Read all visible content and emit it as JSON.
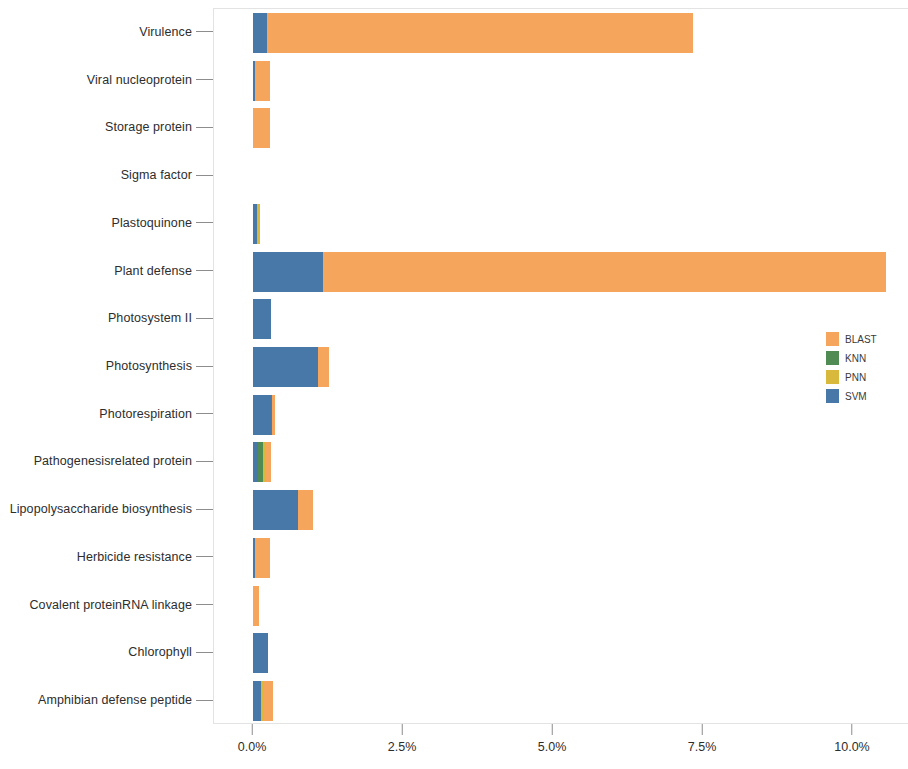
{
  "chart_data": {
    "type": "bar",
    "orientation": "horizontal",
    "stacked": true,
    "title": "",
    "subtitle": "",
    "xlabel": "",
    "ylabel": "",
    "xlim": [
      0,
      11.583
    ],
    "xtick_labels": [
      "0.0%",
      "2.5%",
      "5.0%",
      "7.5%",
      "10.0%"
    ],
    "xtick_values": [
      0,
      2.5,
      5.0,
      7.5,
      10.0
    ],
    "grid": false,
    "legend_position": "right",
    "legend": [
      "BLAST",
      "KNN",
      "PNN",
      "SVM"
    ],
    "series_colors": {
      "BLAST": "#f5a55c",
      "KNN": "#4f8b52",
      "PNN": "#d8b93c",
      "SVM": "#4878a8"
    },
    "categories": [
      "Virulence",
      "Viral nucleoprotein",
      "Storage protein",
      "Sigma factor",
      "Plastoquinone",
      "Plant defense",
      "Photosystem II",
      "Photosynthesis",
      "Photorespiration",
      "Pathogenesisrelated protein",
      "Lipopolysaccharide biosynthesis",
      "Herbicide resistance",
      "Covalent proteinRNA linkage",
      "Chlorophyll",
      "Amphibian defense peptide"
    ],
    "series": [
      {
        "name": "SVM",
        "values": [
          0.233,
          0.033,
          0.0,
          0.0,
          0.067,
          1.167,
          0.3,
          1.083,
          0.3,
          0.083,
          0.75,
          0.033,
          0.0,
          0.25,
          0.133
        ]
      },
      {
        "name": "KNN",
        "values": [
          0.0,
          0.0,
          0.0,
          0.0,
          0.0,
          0.0,
          0.0,
          0.0,
          0.017,
          0.083,
          0.0,
          0.0,
          0.0,
          0.0,
          0.0
        ]
      },
      {
        "name": "PNN",
        "values": [
          0.0,
          0.0,
          0.0,
          0.0,
          0.05,
          0.0,
          0.0,
          0.0,
          0.0,
          0.05,
          0.0,
          0.0,
          0.0,
          0.0,
          0.05
        ]
      },
      {
        "name": "BLAST",
        "values": [
          7.1,
          0.25,
          0.283,
          0.0,
          0.0,
          9.383,
          0.0,
          0.183,
          0.05,
          0.083,
          0.25,
          0.25,
          0.1,
          0.0,
          0.15
        ]
      }
    ],
    "stack_order": [
      "SVM",
      "KNN",
      "PNN",
      "BLAST"
    ],
    "totals": [
      7.333,
      0.283,
      0.283,
      0.0,
      0.117,
      10.55,
      0.3,
      1.267,
      0.367,
      0.3,
      1.0,
      0.283,
      0.1,
      0.25,
      0.333
    ]
  }
}
